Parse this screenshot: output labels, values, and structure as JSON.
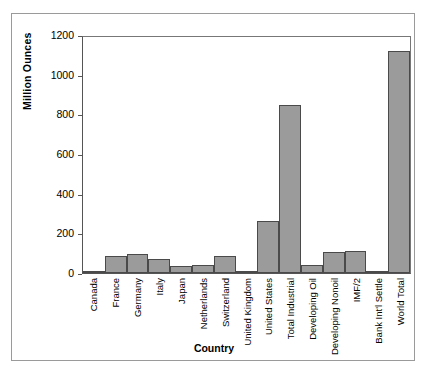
{
  "chart_data": {
    "type": "bar",
    "title": "",
    "xlabel": "Country",
    "ylabel": "Million Ounces",
    "ylim": [
      0,
      1200
    ],
    "yticks": [
      0,
      200,
      400,
      600,
      800,
      1000,
      1200
    ],
    "grid": false,
    "legend": "none",
    "bar_color": "#9b9b9b",
    "bar_edge_color": "#4a4a4a",
    "categories": [
      "Canada",
      "France",
      "Germany",
      "Italy",
      "Japan",
      "Netherlands",
      "Switzerland",
      "United Kingdom",
      "United States",
      "Total Industrial",
      "Developing Oil",
      "Developing Nonoil",
      "IMF/2",
      "Bank Int'l Settle",
      "World Total"
    ],
    "values": [
      4,
      86,
      97,
      72,
      35,
      40,
      86,
      6,
      262,
      849,
      42,
      105,
      112,
      4,
      1120
    ]
  }
}
